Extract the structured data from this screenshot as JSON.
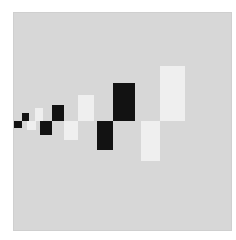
{
  "artwork": {
    "title": "Geometric composition of black and white rectangles",
    "colors": {
      "page": "#ffffff",
      "canvas": "#d7d7d7",
      "black": "#121212",
      "white": "#efefef"
    },
    "canvas": {
      "x": 13,
      "y": 12,
      "w": 219,
      "h": 219
    },
    "blocks": [
      {
        "id": "b1",
        "color": "black",
        "x": 14,
        "y": 121,
        "w": 8,
        "h": 7
      },
      {
        "id": "b2",
        "color": "black",
        "x": 22,
        "y": 113,
        "w": 7,
        "h": 8
      },
      {
        "id": "w1",
        "color": "white",
        "x": 27,
        "y": 121,
        "w": 9,
        "h": 9
      },
      {
        "id": "w2",
        "color": "white",
        "x": 35,
        "y": 108,
        "w": 8,
        "h": 13
      },
      {
        "id": "b3",
        "color": "black",
        "x": 40,
        "y": 121,
        "w": 12,
        "h": 14
      },
      {
        "id": "b4",
        "color": "black",
        "x": 52,
        "y": 105,
        "w": 12,
        "h": 16
      },
      {
        "id": "w3",
        "color": "white",
        "x": 64,
        "y": 121,
        "w": 14,
        "h": 19
      },
      {
        "id": "w4",
        "color": "white",
        "x": 78,
        "y": 95,
        "w": 16,
        "h": 26
      },
      {
        "id": "b5",
        "color": "black",
        "x": 97,
        "y": 121,
        "w": 16,
        "h": 29
      },
      {
        "id": "b6",
        "color": "black",
        "x": 113,
        "y": 83,
        "w": 22,
        "h": 38
      },
      {
        "id": "w5",
        "color": "white",
        "x": 141,
        "y": 121,
        "w": 19,
        "h": 40
      },
      {
        "id": "w6",
        "color": "white",
        "x": 160,
        "y": 66,
        "w": 25,
        "h": 55
      }
    ]
  }
}
